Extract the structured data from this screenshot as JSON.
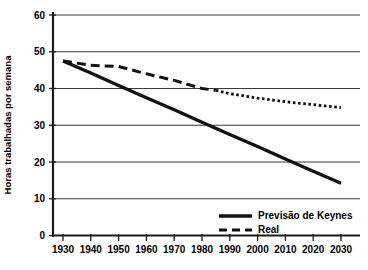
{
  "chart_data": {
    "type": "line",
    "title": "",
    "xlabel": "",
    "ylabel": "Horas trabalhadas por semana",
    "xlim": [
      1925,
      2035
    ],
    "ylim": [
      0,
      60
    ],
    "grid": true,
    "legend_position": "bottom-right",
    "y_ticks": [
      0,
      10,
      20,
      30,
      40,
      50,
      60
    ],
    "y_tick_labels": [
      "0",
      "10",
      "20",
      "30",
      "40",
      "50",
      "60"
    ],
    "x_ticks": [
      1930,
      1940,
      1950,
      1960,
      1970,
      1980,
      1990,
      2000,
      2010,
      2020,
      2030
    ],
    "x_tick_labels": [
      "1930",
      "1940",
      "1950",
      "1960",
      "1970",
      "1980",
      "1990",
      "2000",
      "2010",
      "2020",
      "2030"
    ],
    "series": [
      {
        "name": "Previsão de Keynes",
        "style": "solid",
        "color": "#111111",
        "x": [
          1930,
          1940,
          1950,
          1960,
          1970,
          1980,
          1990,
          2000,
          2010,
          2020,
          2030
        ],
        "values": [
          47.5,
          44.2,
          40.8,
          37.5,
          34.2,
          30.8,
          27.5,
          24.2,
          20.8,
          17.5,
          14.2
        ]
      },
      {
        "name": "Real",
        "style": "dashed",
        "color": "#111111",
        "x": [
          1930,
          1940,
          1950,
          1960,
          1970,
          1980,
          1985,
          1990,
          2000,
          2010,
          2020,
          2030
        ],
        "values": [
          47.5,
          46.3,
          46.0,
          44.0,
          42.2,
          40.0,
          39.5,
          38.6,
          37.4,
          36.4,
          35.6,
          34.8
        ]
      }
    ]
  },
  "axis": {
    "y_title": "Horas trabalhadas por semana"
  },
  "legend": {
    "items": [
      {
        "label": "Previsão de Keynes",
        "style": "solid"
      },
      {
        "label": "Real",
        "style": "dashed"
      }
    ]
  }
}
